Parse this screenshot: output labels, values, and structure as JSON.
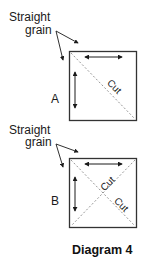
{
  "figure": {
    "caption": "Diagram 4",
    "colors": {
      "ink": "#1a1a1a",
      "frame": "#333333",
      "dashed": "#8a8a8a",
      "background": "#ffffff"
    },
    "panels": [
      {
        "id": "A",
        "label": "A",
        "annotation_line1": "Straight",
        "annotation_line2": "grain",
        "cut_labels": [
          "Cut"
        ],
        "description": "Square cut once along one diagonal; arrows along top and left edges indicate straight grain"
      },
      {
        "id": "B",
        "label": "B",
        "annotation_line1": "Straight",
        "annotation_line2": "grain",
        "cut_labels": [
          "Cut",
          "Cut"
        ],
        "description": "Square cut along both diagonals; arrows along top and left edges indicate straight grain"
      }
    ]
  }
}
